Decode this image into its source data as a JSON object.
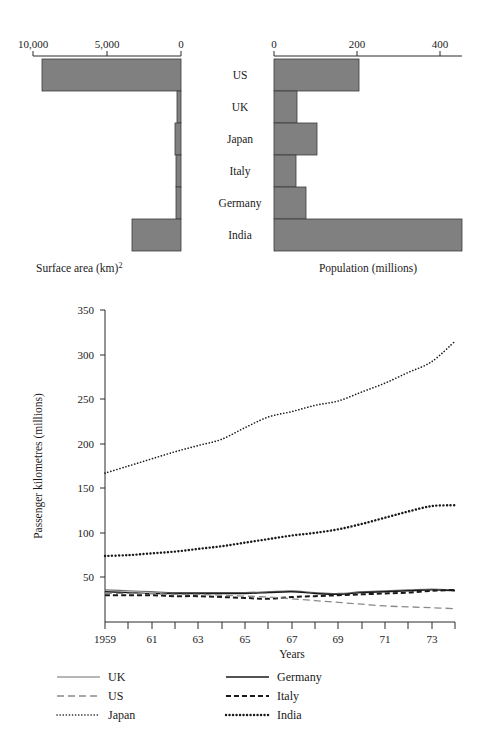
{
  "chart_data": [
    {
      "type": "bar",
      "title": "",
      "orientation": "horizontal-left",
      "xlabel": "Surface area (km)2",
      "ylabel": "",
      "axis_label_main": "Surface area (km)",
      "axis_label_superscript": "2",
      "categories": [
        "US",
        "UK",
        "Japan",
        "Italy",
        "Germany",
        "India"
      ],
      "values": [
        9373000,
        244000,
        378000,
        301000,
        357000,
        3288000
      ],
      "values_thousands_km2": [
        9373,
        244,
        378,
        301,
        357,
        3288
      ],
      "tick_labels": [
        "10,000",
        "5,000",
        "0"
      ],
      "tick_values": [
        10000,
        5000,
        0
      ],
      "xlim": [
        10000,
        0
      ],
      "grid": false,
      "direction": "right-to-left",
      "units": "thousand km2"
    },
    {
      "type": "bar",
      "title": "",
      "orientation": "horizontal-right",
      "xlabel": "Population (millions)",
      "ylabel": "",
      "categories": [
        "US",
        "UK",
        "Japan",
        "Italy",
        "Germany",
        "India"
      ],
      "values": [
        205,
        56,
        104,
        54,
        78,
        548
      ],
      "tick_labels": [
        "0",
        "200",
        "400"
      ],
      "tick_values": [
        0,
        200,
        400
      ],
      "xlim": [
        0,
        500
      ],
      "grid": false,
      "direction": "left-to-right",
      "units": "millions"
    },
    {
      "type": "line",
      "title": "",
      "xlabel": "Years",
      "ylabel": "Passenger kilometres (millions)",
      "x": [
        1959,
        1960,
        1961,
        1962,
        1963,
        1964,
        1965,
        1966,
        1967,
        1968,
        1969,
        1970,
        1971,
        1972,
        1973,
        1974
      ],
      "xtick_labels": [
        "1959",
        "61",
        "63",
        "65",
        "67",
        "69",
        "71",
        "73"
      ],
      "xtick_values": [
        1959,
        1961,
        1963,
        1965,
        1967,
        1969,
        1971,
        1973
      ],
      "ytick_labels": [
        "50",
        "100",
        "150",
        "200",
        "250",
        "300",
        "350"
      ],
      "ytick_values": [
        50,
        100,
        150,
        200,
        250,
        300,
        350
      ],
      "xlim": [
        1959,
        1974
      ],
      "ylim": [
        0,
        350
      ],
      "grid": false,
      "legend_position": "below-plot",
      "series": [
        {
          "name": "UK",
          "style": "solid",
          "values": [
            36,
            35,
            34,
            33,
            33,
            33,
            33,
            34,
            35,
            33,
            32,
            34,
            35,
            36,
            37,
            36
          ]
        },
        {
          "name": "US",
          "style": "dashed-long",
          "values": [
            32,
            32,
            32,
            31,
            31,
            30,
            29,
            28,
            26,
            24,
            22,
            20,
            18,
            17,
            16,
            15
          ]
        },
        {
          "name": "Japan",
          "style": "dotted-fine",
          "values": [
            167,
            175,
            183,
            191,
            198,
            205,
            218,
            230,
            236,
            243,
            248,
            258,
            268,
            280,
            292,
            315
          ]
        },
        {
          "name": "Germany",
          "style": "solid",
          "values": [
            34,
            33,
            32,
            32,
            32,
            32,
            32,
            33,
            34,
            32,
            31,
            33,
            34,
            35,
            36,
            35
          ]
        },
        {
          "name": "Italy",
          "style": "dashed-short",
          "values": [
            30,
            30,
            30,
            29,
            29,
            28,
            27,
            26,
            28,
            29,
            30,
            31,
            32,
            33,
            35,
            36
          ]
        },
        {
          "name": "India",
          "style": "dotted-bold",
          "values": [
            74,
            75,
            77,
            79,
            82,
            85,
            89,
            93,
            97,
            100,
            104,
            110,
            117,
            124,
            130,
            131
          ]
        }
      ],
      "legend": [
        {
          "label": "UK",
          "style": "solid"
        },
        {
          "label": "Germany",
          "style": "solid"
        },
        {
          "label": "US",
          "style": "dashed-long"
        },
        {
          "label": "Italy",
          "style": "dashed-short"
        },
        {
          "label": "Japan",
          "style": "dotted-fine"
        },
        {
          "label": "India",
          "style": "dotted-bold"
        }
      ]
    }
  ],
  "pyramid": {
    "left_ticks": [
      "10,000",
      "5,000",
      "0"
    ],
    "right_ticks": [
      "0",
      "200",
      "400"
    ],
    "categories": [
      "US",
      "UK",
      "Japan",
      "Italy",
      "Germany",
      "India"
    ],
    "left_axis_label": "Surface area (km)",
    "left_axis_superscript": "2",
    "right_axis_label": "Population (millions)"
  },
  "linechart": {
    "y_axis_title": "Passenger kilometres (millions)",
    "x_axis_title": "Years",
    "y_ticks": [
      "350",
      "300",
      "250",
      "200",
      "150",
      "100",
      "50"
    ],
    "x_ticks": [
      "1959",
      "61",
      "63",
      "65",
      "67",
      "69",
      "71",
      "73"
    ],
    "legend": {
      "uk": "UK",
      "us": "US",
      "japan": "Japan",
      "germany": "Germany",
      "italy": "Italy",
      "india": "India"
    }
  },
  "colors": {
    "bar_fill": "#808080",
    "bar_stroke": "#3a3a3a",
    "ink": "#1a1a1a",
    "background": "#ffffff"
  }
}
